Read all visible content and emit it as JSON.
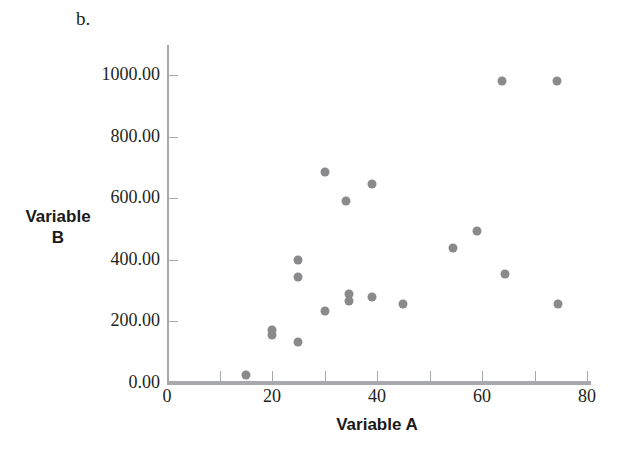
{
  "panel": {
    "letter": "b."
  },
  "chart_data": {
    "type": "scatter",
    "title": "",
    "xlabel": "Variable A",
    "ylabel": "Variable\nB",
    "ylabel_line1": "Variable",
    "ylabel_line2": "B",
    "xlim": [
      0,
      85
    ],
    "ylim": [
      0,
      1080
    ],
    "grid": false,
    "legend": null,
    "xticks": [
      0,
      20,
      40,
      60,
      80
    ],
    "xtick_labels": [
      "0",
      "20",
      "40",
      "60",
      "80"
    ],
    "xminor_ticks": [
      10,
      30,
      50,
      70
    ],
    "yticks": [
      0,
      200,
      400,
      600,
      800,
      1000
    ],
    "ytick_labels": [
      "0.00",
      "200.00",
      "400.00",
      "600.00",
      "800.00",
      "1000.00"
    ],
    "marker_color": "#8a8a8d",
    "axis_color": "#a7a9ac",
    "points": [
      {
        "x": 15.0,
        "y": 25
      },
      {
        "x": 20.0,
        "y": 173
      },
      {
        "x": 20.0,
        "y": 155
      },
      {
        "x": 25.0,
        "y": 400
      },
      {
        "x": 25.0,
        "y": 345
      },
      {
        "x": 25.0,
        "y": 133
      },
      {
        "x": 30.0,
        "y": 685
      },
      {
        "x": 30.0,
        "y": 233
      },
      {
        "x": 34.0,
        "y": 592
      },
      {
        "x": 34.7,
        "y": 290
      },
      {
        "x": 34.7,
        "y": 267
      },
      {
        "x": 39.0,
        "y": 645
      },
      {
        "x": 39.0,
        "y": 278
      },
      {
        "x": 45.0,
        "y": 258
      },
      {
        "x": 54.5,
        "y": 438
      },
      {
        "x": 59.0,
        "y": 493
      },
      {
        "x": 63.8,
        "y": 980
      },
      {
        "x": 64.4,
        "y": 354
      },
      {
        "x": 74.3,
        "y": 980
      },
      {
        "x": 74.5,
        "y": 256
      }
    ]
  }
}
